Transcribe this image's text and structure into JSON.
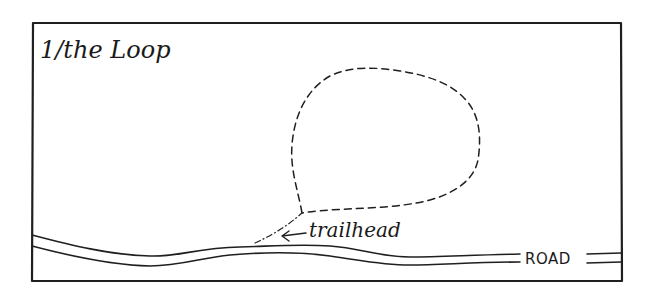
{
  "diagram": {
    "title": "1/the Loop",
    "labels": {
      "trailhead": "trailhead",
      "road": "ROAD"
    },
    "elements": [
      {
        "name": "frame",
        "type": "rectangle",
        "style": "solid"
      },
      {
        "name": "loop-trail",
        "type": "closed-path",
        "style": "dashed"
      },
      {
        "name": "trail-spur",
        "type": "path",
        "style": "dash-dot",
        "connects": [
          "road",
          "loop-trail"
        ]
      },
      {
        "name": "road",
        "type": "double-line",
        "style": "solid"
      },
      {
        "name": "trailhead-arrow",
        "type": "arrow",
        "points_to": "trail-spur"
      }
    ],
    "colors": {
      "ink": "#1f1f1f",
      "background": "#ffffff"
    }
  }
}
